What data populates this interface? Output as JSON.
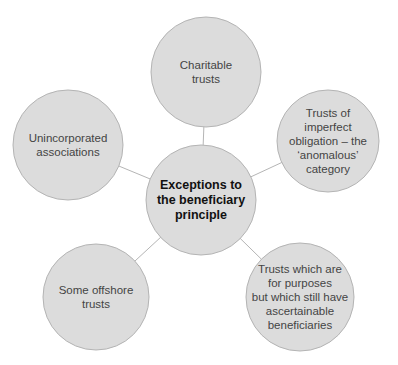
{
  "diagram": {
    "type": "hub-and-spoke",
    "colors": {
      "circle_fill": "#dcdcdc",
      "circle_stroke": "#b4b4b4",
      "connector": "#b5b5b5",
      "center_text": "#111111",
      "node_text": "#444444"
    },
    "center": {
      "label": "Exceptions to the beneficiary principle",
      "lines": [
        "Exceptions to",
        "the beneficiary",
        "principle"
      ],
      "cx": 201,
      "cy": 200,
      "r": 55
    },
    "nodes": [
      {
        "id": "charitable-trusts",
        "label": "Charitable trusts",
        "lines": [
          "Charitable",
          "trusts"
        ],
        "cx": 206,
        "cy": 72,
        "r": 55
      },
      {
        "id": "imperfect-obligation",
        "label": "Trusts of imperfect obligation – the ‘anomalous’ category",
        "lines": [
          "Trusts of",
          "imperfect",
          "obligation – the",
          "‘anomalous’",
          "category"
        ],
        "cx": 328,
        "cy": 141,
        "r": 51
      },
      {
        "id": "purpose-trusts-with-beneficiaries",
        "label": "Trusts which are for purposes but which still have ascertainable beneficiaries",
        "lines": [
          "Trusts which are",
          "for purposes",
          "but which still have",
          "ascertainable",
          "beneficiaries"
        ],
        "cx": 300,
        "cy": 297,
        "r": 54
      },
      {
        "id": "offshore-trusts",
        "label": "Some offshore trusts",
        "lines": [
          "Some offshore",
          "trusts"
        ],
        "cx": 96,
        "cy": 297,
        "r": 53
      },
      {
        "id": "unincorporated-associations",
        "label": "Unincorporated associations",
        "lines": [
          "Unincorporated",
          "associations"
        ],
        "cx": 68,
        "cy": 145,
        "r": 55
      }
    ]
  }
}
